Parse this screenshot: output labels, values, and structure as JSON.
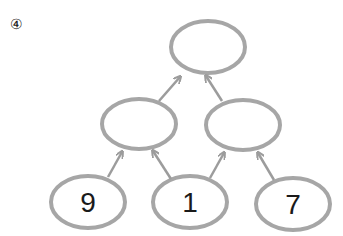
{
  "problem_number": "④",
  "colors": {
    "node_stroke": "#a6a6a6",
    "arrow": "#9c9c9c",
    "text": "#1a1a1a"
  },
  "tree": {
    "top": {
      "value": ""
    },
    "middle": [
      {
        "value": ""
      },
      {
        "value": ""
      }
    ],
    "bottom": [
      {
        "value": "9"
      },
      {
        "value": "1"
      },
      {
        "value": "7"
      }
    ]
  }
}
